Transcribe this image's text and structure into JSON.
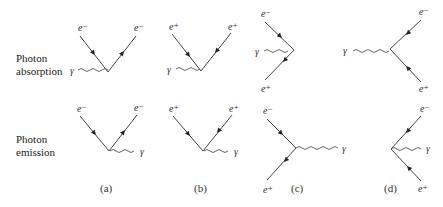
{
  "rows": [
    {
      "label_line1": "Photon",
      "label_line2": "absorption"
    },
    {
      "label_line1": "Photon",
      "label_line2": "emission"
    }
  ],
  "captions": [
    "(a)",
    "(b)",
    "(c)",
    "(d)"
  ],
  "particles": {
    "electron": "e⁻",
    "positron": "e⁺",
    "photon": "γ"
  },
  "diagrams": {
    "absorption": {
      "a": {
        "top_left": "e⁻",
        "top_right": "e⁻",
        "photon": "γ"
      },
      "b": {
        "top_left": "e⁺",
        "top_right": "e⁺",
        "photon": "γ"
      },
      "c": {
        "top": "e⁻",
        "bottom": "e⁺",
        "photon": "γ"
      },
      "d": {
        "top": "e⁻",
        "bottom": "e⁺",
        "photon": "γ"
      }
    },
    "emission": {
      "a": {
        "top_left": "e⁻",
        "top_right": "e⁻",
        "photon": "γ"
      },
      "b": {
        "top_left": "e⁺",
        "top_right": "e⁺",
        "photon": "γ"
      },
      "c": {
        "top": "e⁻",
        "bottom": "e⁺",
        "photon": "γ"
      },
      "d": {
        "top": "e⁻",
        "bottom": "e⁺",
        "photon": "γ"
      }
    }
  }
}
